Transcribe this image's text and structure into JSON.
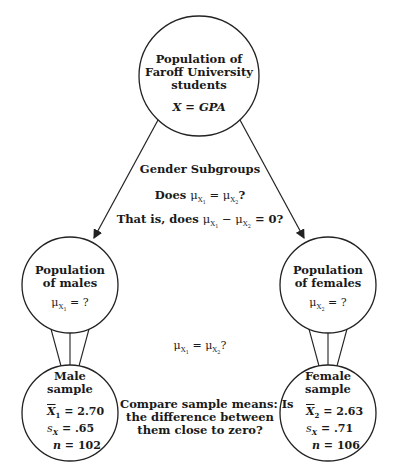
{
  "diagram": {
    "top_node": {
      "title_lines": [
        "Population of",
        "Faroff University",
        "students"
      ],
      "variable": "X = GPA"
    },
    "middle_annotation": {
      "heading": "Gender Subgroups",
      "question1_prefix": "Does ",
      "question1_mu": "μ",
      "question1_sub1": "X",
      "question1_subsub1": "1",
      "question1_eq": " = ",
      "question1_sub2": "X",
      "question1_subsub2": "2",
      "question1_suffix": "?",
      "question2_prefix": "That is, does ",
      "question2_minus": " − ",
      "question2_suffix": " = 0?"
    },
    "left_population": {
      "title_lines": [
        "Population",
        "of males"
      ],
      "mu_label": "μ",
      "sub": "X",
      "subsub": "1",
      "value": " = ?"
    },
    "right_population": {
      "title_lines": [
        "Population",
        "of females"
      ],
      "mu_label": "μ",
      "sub": "X",
      "subsub": "2",
      "value": " = ?"
    },
    "center_equation": {
      "mu": "μ",
      "sub1": "X",
      "subsub1": "1",
      "eq": " = ",
      "sub2": "X",
      "subsub2": "2",
      "suffix": "?"
    },
    "left_sample": {
      "title_lines": [
        "Male",
        "sample"
      ],
      "mean_symbol": "X",
      "mean_sub": "1",
      "mean_value": " = 2.70",
      "sd_symbol": "s",
      "sd_sub": "X",
      "sd_value": " = .65",
      "n_symbol": "n",
      "n_value": " = 102"
    },
    "right_sample": {
      "title_lines": [
        "Female",
        "sample"
      ],
      "mean_symbol": "X",
      "mean_sub": "2",
      "mean_value": " = 2.63",
      "sd_symbol": "s",
      "sd_sub": "X",
      "sd_value": " = .71",
      "n_symbol": "n",
      "n_value": " = 106"
    },
    "bottom_annotation": {
      "lines": [
        "Compare sample means: Is",
        "the difference between",
        "them close to zero?"
      ]
    },
    "colors": {
      "stroke": "#222222",
      "text": "#1a1a1a",
      "background": "#ffffff"
    }
  }
}
